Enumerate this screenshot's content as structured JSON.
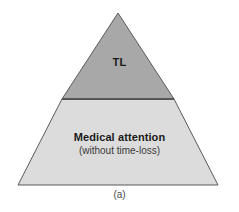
{
  "figure": {
    "caption": "(a)",
    "background_color": "#ffffff",
    "outline_color": "#5a5a5a",
    "geometry": {
      "apex": [
        118,
        13
      ],
      "base_left": [
        18,
        185
      ],
      "base_right": [
        218,
        185
      ],
      "divider_y": 99,
      "divider_left_x": 62,
      "divider_right_x": 174
    },
    "tiers": [
      {
        "id": "top",
        "label": "TL",
        "sublabel": "",
        "fill_color": "#a8a8a8"
      },
      {
        "id": "bottom",
        "label": "Medical attention",
        "sublabel": "(without time-loss)",
        "fill_color": "#dcdcdc"
      }
    ]
  }
}
